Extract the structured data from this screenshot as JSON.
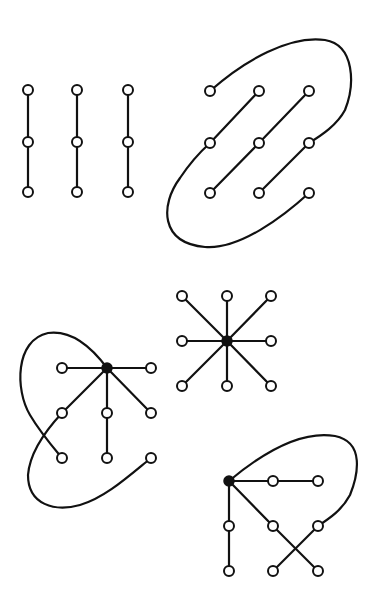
{
  "colors": {
    "ink": "#111111",
    "background": "#ffffff"
  },
  "figures": [
    {
      "id": "three-paths",
      "description": "Three disjoint vertical paths of three vertices each",
      "nodes": [
        {
          "x": 28,
          "y": 90,
          "filled": false
        },
        {
          "x": 28,
          "y": 142,
          "filled": false
        },
        {
          "x": 28,
          "y": 192,
          "filled": false
        },
        {
          "x": 77,
          "y": 90,
          "filled": false
        },
        {
          "x": 77,
          "y": 142,
          "filled": false
        },
        {
          "x": 77,
          "y": 192,
          "filled": false
        },
        {
          "x": 128,
          "y": 90,
          "filled": false
        },
        {
          "x": 128,
          "y": 142,
          "filled": false
        },
        {
          "x": 128,
          "y": 192,
          "filled": false
        }
      ],
      "edges": [
        [
          0,
          1
        ],
        [
          1,
          2
        ],
        [
          3,
          4
        ],
        [
          4,
          5
        ],
        [
          6,
          7
        ],
        [
          7,
          8
        ]
      ],
      "curves": []
    },
    {
      "id": "grid-loop",
      "description": "3x3 grid of vertices joined into a single path by diagonals and two looping curves",
      "nodes": [
        {
          "x": 210,
          "y": 91,
          "filled": false
        },
        {
          "x": 259,
          "y": 91,
          "filled": false
        },
        {
          "x": 309,
          "y": 91,
          "filled": false
        },
        {
          "x": 210,
          "y": 143,
          "filled": false
        },
        {
          "x": 259,
          "y": 143,
          "filled": false
        },
        {
          "x": 309,
          "y": 143,
          "filled": false
        },
        {
          "x": 210,
          "y": 193,
          "filled": false
        },
        {
          "x": 259,
          "y": 193,
          "filled": false
        },
        {
          "x": 309,
          "y": 193,
          "filled": false
        }
      ],
      "edges": [
        [
          1,
          3
        ],
        [
          2,
          4
        ],
        [
          4,
          6
        ],
        [
          5,
          7
        ]
      ],
      "curves": [
        "M210,91 C245,60 290,35 325,40 C355,45 355,85 345,110 C337,125 322,135 309,143",
        "M309,193 C285,215 240,250 205,247 C160,243 160,205 180,178 C190,163 200,152 210,143"
      ]
    },
    {
      "id": "star",
      "description": "Star graph: one filled center vertex joined to eight outer vertices",
      "nodes": [
        {
          "x": 227,
          "y": 341,
          "filled": true
        },
        {
          "x": 182,
          "y": 296,
          "filled": false
        },
        {
          "x": 227,
          "y": 296,
          "filled": false
        },
        {
          "x": 271,
          "y": 296,
          "filled": false
        },
        {
          "x": 182,
          "y": 341,
          "filled": false
        },
        {
          "x": 271,
          "y": 341,
          "filled": false
        },
        {
          "x": 182,
          "y": 386,
          "filled": false
        },
        {
          "x": 227,
          "y": 386,
          "filled": false
        },
        {
          "x": 271,
          "y": 386,
          "filled": false
        }
      ],
      "edges": [
        [
          0,
          1
        ],
        [
          0,
          2
        ],
        [
          0,
          3
        ],
        [
          0,
          4
        ],
        [
          0,
          5
        ],
        [
          0,
          6
        ],
        [
          0,
          7
        ],
        [
          0,
          8
        ]
      ],
      "curves": []
    },
    {
      "id": "hub-left-loop",
      "description": "Filled hub vertex with spokes and a looping curve crossing on the left",
      "nodes": [
        {
          "x": 107,
          "y": 368,
          "filled": true
        },
        {
          "x": 62,
          "y": 368,
          "filled": false
        },
        {
          "x": 151,
          "y": 368,
          "filled": false
        },
        {
          "x": 62,
          "y": 413,
          "filled": false
        },
        {
          "x": 107,
          "y": 413,
          "filled": false
        },
        {
          "x": 151,
          "y": 413,
          "filled": false
        },
        {
          "x": 62,
          "y": 458,
          "filled": false
        },
        {
          "x": 107,
          "y": 458,
          "filled": false
        },
        {
          "x": 151,
          "y": 458,
          "filled": false
        }
      ],
      "edges": [
        [
          0,
          1
        ],
        [
          0,
          2
        ],
        [
          0,
          3
        ],
        [
          0,
          4
        ],
        [
          0,
          5
        ],
        [
          4,
          7
        ]
      ],
      "curves": [
        "M107,368 C90,345 70,330 48,333 C15,340 15,390 30,415 C40,432 52,446 62,458",
        "M62,413 C48,428 30,450 28,475 C28,505 55,512 80,505 C105,498 130,475 151,458"
      ]
    },
    {
      "id": "hub-right-loop",
      "description": "Filled hub vertex with paths, a crossing and a loop over the top right",
      "nodes": [
        {
          "x": 229,
          "y": 481,
          "filled": true
        },
        {
          "x": 273,
          "y": 481,
          "filled": false
        },
        {
          "x": 318,
          "y": 481,
          "filled": false
        },
        {
          "x": 229,
          "y": 526,
          "filled": false
        },
        {
          "x": 273,
          "y": 526,
          "filled": false
        },
        {
          "x": 318,
          "y": 526,
          "filled": false
        },
        {
          "x": 229,
          "y": 571,
          "filled": false
        },
        {
          "x": 273,
          "y": 571,
          "filled": false
        },
        {
          "x": 318,
          "y": 571,
          "filled": false
        }
      ],
      "edges": [
        [
          0,
          1
        ],
        [
          1,
          2
        ],
        [
          0,
          3
        ],
        [
          3,
          6
        ],
        [
          0,
          4
        ],
        [
          4,
          8
        ],
        [
          5,
          7
        ]
      ],
      "curves": [
        "M229,481 C260,455 300,430 335,436 C365,442 358,475 350,495 C342,510 330,518 318,526"
      ]
    }
  ]
}
